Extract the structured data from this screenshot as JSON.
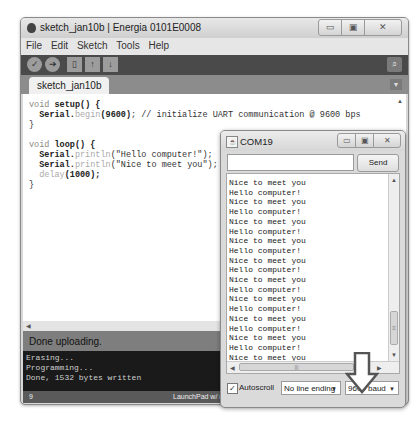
{
  "ide": {
    "title": "sketch_jan10b | Energia 0101E0008",
    "window_controls": [
      "minimize",
      "maximize",
      "close"
    ],
    "menu": [
      "File",
      "Edit",
      "Sketch",
      "Tools",
      "Help"
    ],
    "toolbar": {
      "verify": "verify-icon",
      "upload": "upload-icon",
      "new": "new-icon",
      "open": "open-icon",
      "save": "save-icon",
      "serial_monitor": "serial-monitor-icon"
    },
    "tab": "sketch_jan10b §",
    "code": {
      "line1_kw": "void ",
      "line1_fn": "setup",
      "line1_rest": "() {",
      "line2_obj": "  Serial.",
      "line2_fn": "begin",
      "line2_arg": "(9600)",
      "line2_rest": "; // initialize UART communication @ 9600 bps",
      "line3": "}",
      "line5_kw": "void ",
      "line5_fn": "loop",
      "line5_rest": "() {",
      "line6_obj": "  Serial.",
      "line6_fn": "println",
      "line6_arg": "(\"Hello computer!\");",
      "line7_obj": "  Serial.",
      "line7_fn": "println",
      "line7_arg": "(\"Nice to meet you\");",
      "line8_fn": "  delay",
      "line8_arg": "(1000);",
      "line9": "}"
    },
    "status": "Done uploading.",
    "console": [
      "Erasing...",
      "Programming...",
      "Done, 1532 bytes written"
    ],
    "footer": {
      "line_number": "9",
      "board": "LaunchPad w/ m"
    }
  },
  "serial_monitor": {
    "title": "COM19",
    "input_value": "",
    "send_label": "Send",
    "output_lines": [
      "Nice to meet you",
      "Hello computer!",
      "Nice to meet you",
      "Hello computer!",
      "Nice to meet you",
      "Hello computer!",
      "Nice to meet you",
      "Hello computer!",
      "Nice to meet you",
      "Hello computer!",
      "Nice to meet you",
      "Hello computer!",
      "Nice to meet you",
      "Hello computer!",
      "Nice to meet you",
      "Hello computer!",
      "Nice to meet you",
      "Hello computer!",
      "Nice to meet you"
    ],
    "autoscroll_label": "Autoscroll",
    "autoscroll_checked": "✓",
    "line_ending": "No line ending",
    "baud": "9600 baud"
  },
  "annotation": {
    "arrow": "down-arrow-icon"
  }
}
